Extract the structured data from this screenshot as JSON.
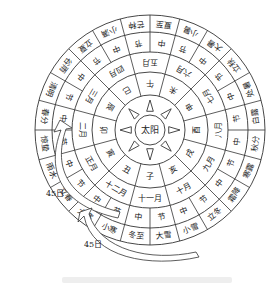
{
  "diagram": {
    "center_label": "太阳",
    "solar_terms_clockwise_from_top": [
      "夏至",
      "小暑",
      "大暑",
      "立秋",
      "处暑",
      "白露",
      "秋分",
      "寒露",
      "霜降",
      "立冬",
      "小雪",
      "大雪",
      "冬至",
      "小寒",
      "大寒",
      "立春",
      "雨水",
      "惊蛰",
      "春分",
      "清明",
      "谷雨",
      "立夏",
      "小满",
      "芒种"
    ],
    "jie_zhong_clockwise_from_top": [
      "中",
      "节",
      "中",
      "节",
      "中",
      "节",
      "中",
      "节",
      "中",
      "节",
      "中",
      "节",
      "中",
      "节",
      "中",
      "节",
      "中",
      "节",
      "中",
      "节",
      "中",
      "节",
      "中",
      "节"
    ],
    "months_clockwise_from_top": [
      "五月",
      "六月",
      "七月",
      "八月",
      "九月",
      "十月",
      "十一月",
      "十二月",
      "正月",
      "二月",
      "三月",
      "四月"
    ],
    "branches_clockwise_from_top": [
      "午",
      "未",
      "申",
      "酉",
      "戌",
      "亥",
      "子",
      "丑",
      "寅",
      "卯",
      "辰",
      "巳"
    ],
    "arrows": [
      {
        "label": "45日"
      },
      {
        "label": "45日"
      }
    ],
    "colors": {
      "line": "#333333",
      "text": "#222222",
      "background": "#ffffff"
    }
  }
}
